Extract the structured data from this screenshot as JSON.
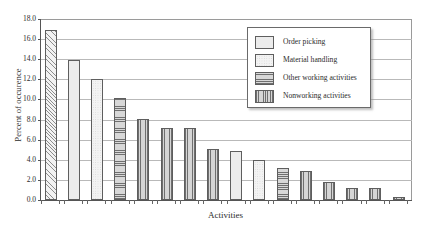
{
  "chart_data": {
    "type": "bar",
    "title": "",
    "xlabel": "Activities",
    "ylabel": "Percent of occurence",
    "ylim": [
      0.0,
      18.0
    ],
    "ytick_labels": [
      "18.0",
      "16.0",
      "14.0",
      "12.0",
      "10.0",
      "8.0",
      "6.0",
      "4.0",
      "2.0",
      "0.0"
    ],
    "ytick_values": [
      18.0,
      16.0,
      14.0,
      12.0,
      10.0,
      8.0,
      6.0,
      4.0,
      2.0,
      0.0
    ],
    "grid": true,
    "legend_position": "upper-right",
    "categories": [
      "1",
      "2",
      "3",
      "4",
      "5",
      "6",
      "7",
      "8",
      "9",
      "10",
      "11",
      "12",
      "13",
      "14",
      "15",
      "16"
    ],
    "values": [
      16.9,
      13.9,
      12.0,
      10.1,
      8.1,
      7.2,
      7.2,
      5.1,
      4.9,
      4.0,
      3.2,
      2.9,
      1.8,
      1.2,
      1.2,
      0.3
    ],
    "bar_groups": [
      "diagonal",
      "order-picking",
      "material-handling",
      "other-working",
      "nonworking",
      "nonworking",
      "nonworking",
      "nonworking",
      "order-picking",
      "material-handling",
      "other-working",
      "nonworking",
      "nonworking",
      "nonworking",
      "nonworking",
      "nonworking"
    ],
    "legend": [
      {
        "label": "Order picking",
        "pattern": "dots"
      },
      {
        "label": "Material handling",
        "pattern": "plain"
      },
      {
        "label": "Other working activities",
        "pattern": "horizontal-lines"
      },
      {
        "label": "Nonworking activities",
        "pattern": "vertical-lines"
      }
    ],
    "colors": {
      "axis": "#555555",
      "gridline": "#b9b9b9",
      "bar_outline": "#5e5e5e",
      "background": "#ffffff"
    }
  }
}
